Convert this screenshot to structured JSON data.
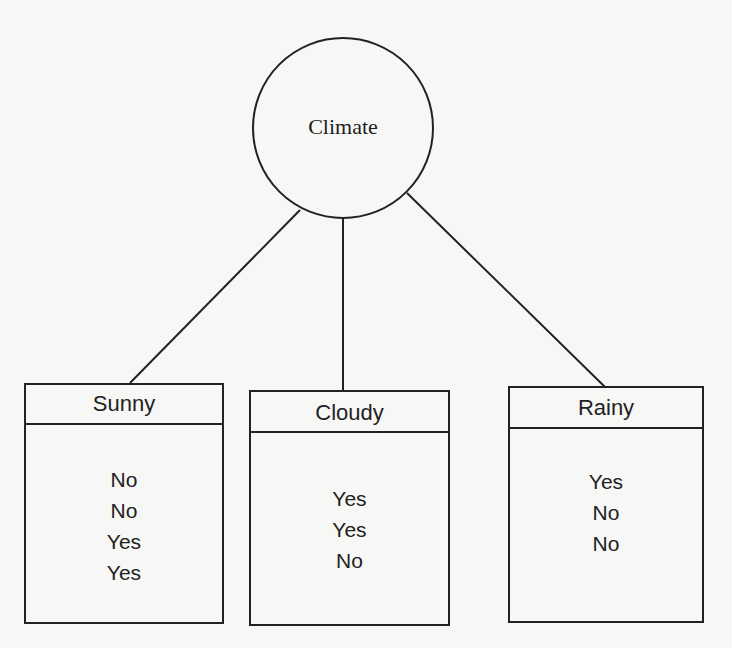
{
  "diagram": {
    "type": "decision-tree",
    "root": {
      "label": "Climate"
    },
    "branches": [
      {
        "label": "Sunny",
        "outcomes": [
          "No",
          "No",
          "Yes",
          "Yes"
        ]
      },
      {
        "label": "Cloudy",
        "outcomes": [
          "Yes",
          "Yes",
          "No"
        ]
      },
      {
        "label": "Rainy",
        "outcomes": [
          "Yes",
          "No",
          "No"
        ]
      }
    ],
    "colors": {
      "stroke": "#222222",
      "background": "#f7f7f5"
    }
  }
}
